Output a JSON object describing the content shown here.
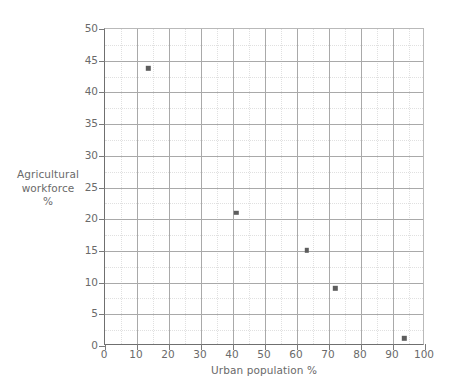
{
  "chart_data": {
    "type": "scatter",
    "title": "",
    "xlabel": "Urban population %",
    "ylabel": "Agricultural workforce %",
    "ylabel_lines": [
      "Agricultural",
      "workforce",
      "%"
    ],
    "xlim": [
      0,
      100
    ],
    "ylim": [
      0,
      50
    ],
    "xticks": [
      0,
      10,
      20,
      30,
      40,
      50,
      60,
      70,
      80,
      90,
      100
    ],
    "yticks": [
      0,
      5,
      10,
      15,
      20,
      25,
      30,
      35,
      40,
      45,
      50
    ],
    "xtick_labels": [
      "0",
      "10",
      "20",
      "30",
      "40",
      "50",
      "60",
      "70",
      "80",
      "90",
      "100"
    ],
    "ytick_labels": [
      "0",
      "5",
      "10",
      "15",
      "20",
      "25",
      "30",
      "35",
      "40",
      "45",
      "50"
    ],
    "x_minor_step": 5,
    "y_minor_step": 2.5,
    "grid": true,
    "minor_grid": true,
    "legend": false,
    "marker": "square",
    "marker_color": "#5d5d5d",
    "grid_color": "#a9a9a9",
    "axis_color": "#6f6f6f",
    "text_color": "#6a6a6a",
    "points": [
      {
        "x": 13.5,
        "y": 43.8
      },
      {
        "x": 41.0,
        "y": 21.0
      },
      {
        "x": 63.0,
        "y": 15.1
      },
      {
        "x": 72.0,
        "y": 9.1
      },
      {
        "x": 93.5,
        "y": 1.2
      }
    ]
  }
}
